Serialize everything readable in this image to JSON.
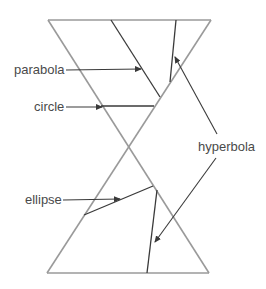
{
  "diagram": {
    "labels": {
      "parabola": "parabola",
      "circle": "circle",
      "hyperbola": "hyperbola",
      "ellipse": "ellipse"
    },
    "colors": {
      "cone": "#9a9a9a",
      "section": "#3a3a3a",
      "text": "#4a4a4a",
      "background": "#ffffff"
    }
  }
}
